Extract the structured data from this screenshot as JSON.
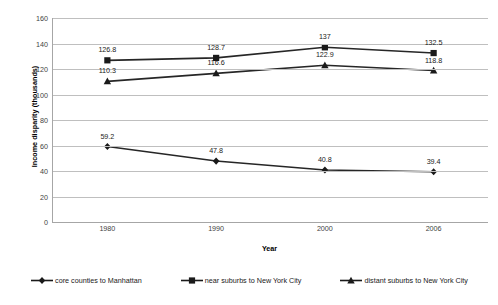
{
  "chart_data": {
    "type": "line",
    "title": "",
    "xlabel": "Year",
    "ylabel": "Income disparity (thousands)",
    "categories": [
      "1980",
      "1990",
      "2000",
      "2006"
    ],
    "ylim": [
      0,
      160
    ],
    "yticks": [
      "0",
      "20",
      "40",
      "60",
      "80",
      "100",
      "120",
      "140",
      "160"
    ],
    "ytick_values": [
      0,
      20,
      40,
      60,
      80,
      100,
      120,
      140,
      160
    ],
    "grid": "horizontal",
    "legend_position": "bottom",
    "series": [
      {
        "name": "core counties to Manhattan",
        "marker": "diamond",
        "color": "#1a1a1a",
        "values": [
          59.2,
          47.8,
          40.8,
          39.4
        ],
        "labels": [
          "59.2",
          "47.8",
          "40.8",
          "39.4"
        ],
        "label_positions": [
          "above",
          "above",
          "above",
          "above"
        ]
      },
      {
        "name": "near suburbs to New York City",
        "marker": "square",
        "color": "#1a1a1a",
        "values": [
          126.8,
          128.7,
          137,
          132.5
        ],
        "labels": [
          "126.8",
          "128.7",
          "137",
          "132.5"
        ],
        "label_positions": [
          "above",
          "above",
          "above",
          "above"
        ]
      },
      {
        "name": "distant suburbs to New York City",
        "marker": "triangle",
        "color": "#1a1a1a",
        "values": [
          110.3,
          116.6,
          122.9,
          118.8
        ],
        "labels": [
          "110.3",
          "116.6",
          "122.9",
          "118.8"
        ],
        "label_positions": [
          "above",
          "above",
          "above",
          "above"
        ]
      }
    ]
  },
  "axis": {
    "x_title": "Year",
    "y_title": "Income disparity (thousands)"
  }
}
